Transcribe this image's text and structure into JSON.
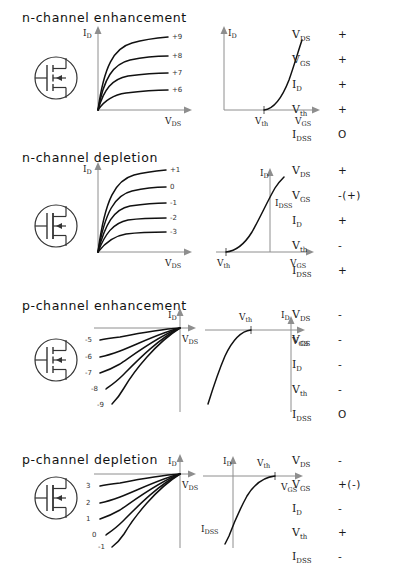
{
  "diagram": {
    "title_hidden": "MOSFET types: output and transfer characteristics with polarity table",
    "param_names": [
      "V_DS",
      "V_GS",
      "I_D",
      "V_th",
      "I_DSS"
    ],
    "sections": [
      {
        "id": "n-channel-enhancement",
        "title": "n-channel enhancement",
        "symbol": {
          "channel": "n",
          "mode": "enhancement",
          "arrow": "in"
        },
        "output_plot": {
          "y_axis_label": "I_D",
          "x_axis_label": "V_DS",
          "curve_labels": [
            "+9",
            "+8",
            "+7",
            "+6"
          ],
          "origin": "bottom-left"
        },
        "transfer_plot": {
          "y_axis_label": "I_D",
          "x_axis_label": "V_GS",
          "threshold_label": "V_th",
          "idss_label": "",
          "origin": "bottom-left"
        },
        "params": [
          {
            "name": "V_DS",
            "sign": "+"
          },
          {
            "name": "V_GS",
            "sign": "+"
          },
          {
            "name": "I_D",
            "sign": "+"
          },
          {
            "name": "V_th",
            "sign": "+"
          },
          {
            "name": "I_DSS",
            "sign": "O"
          }
        ]
      },
      {
        "id": "n-channel-depletion",
        "title": "n-channel depletion",
        "symbol": {
          "channel": "n",
          "mode": "depletion",
          "arrow": "in"
        },
        "output_plot": {
          "y_axis_label": "I_D",
          "x_axis_label": "V_DS",
          "curve_labels": [
            "+1",
            "0",
            "-1",
            "-2",
            "-3"
          ],
          "origin": "bottom-left"
        },
        "transfer_plot": {
          "y_axis_label": "I_D",
          "x_axis_label": "V_GS",
          "threshold_label": "V_th",
          "idss_label": "I_DSS",
          "origin": "bottom-center"
        },
        "params": [
          {
            "name": "V_DS",
            "sign": "+"
          },
          {
            "name": "V_GS",
            "sign": "-(+)"
          },
          {
            "name": "I_D",
            "sign": "+"
          },
          {
            "name": "V_th",
            "sign": "-"
          },
          {
            "name": "I_DSS",
            "sign": "+"
          }
        ]
      },
      {
        "id": "p-channel-enhancement",
        "title": "p-channel enhancement",
        "symbol": {
          "channel": "p",
          "mode": "enhancement",
          "arrow": "in"
        },
        "output_plot": {
          "y_axis_label": "I_D",
          "x_axis_label": "V_DS",
          "curve_labels": [
            "-5",
            "-6",
            "-7",
            "-8",
            "-9"
          ],
          "origin": "top-right"
        },
        "transfer_plot": {
          "y_axis_label": "I_D",
          "x_axis_label": "V_GS",
          "threshold_label": "V_th",
          "idss_label": "",
          "origin": "top-right"
        },
        "params": [
          {
            "name": "V_DS",
            "sign": "-"
          },
          {
            "name": "V_GS",
            "sign": "-"
          },
          {
            "name": "I_D",
            "sign": "-"
          },
          {
            "name": "V_th",
            "sign": "-"
          },
          {
            "name": "I_DSS",
            "sign": "O"
          }
        ]
      },
      {
        "id": "p-channel-depletion",
        "title": "p-channel depletion",
        "symbol": {
          "channel": "p",
          "mode": "depletion",
          "arrow": "in"
        },
        "output_plot": {
          "y_axis_label": "I_D",
          "x_axis_label": "V_DS",
          "curve_labels": [
            "3",
            "2",
            "1",
            "0",
            "-1"
          ],
          "origin": "top-right"
        },
        "transfer_plot": {
          "y_axis_label": "I_D",
          "x_axis_label": "V_GS",
          "threshold_label": "V_th",
          "idss_label": "I_DSS",
          "origin": "top-center"
        },
        "params": [
          {
            "name": "V_DS",
            "sign": "-"
          },
          {
            "name": "V_GS",
            "sign": "+(-)"
          },
          {
            "name": "I_D",
            "sign": "-"
          },
          {
            "name": "V_th",
            "sign": "+"
          },
          {
            "name": "I_DSS",
            "sign": "-"
          }
        ]
      }
    ]
  }
}
